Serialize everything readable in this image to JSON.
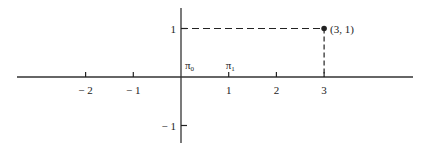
{
  "chart_data": {
    "type": "scatter",
    "title": "",
    "xlabel": "",
    "ylabel": "",
    "xlim": [
      -3.4,
      4.8
    ],
    "ylim": [
      -1.4,
      1.4
    ],
    "x_ticks": [
      {
        "value": -2,
        "label": "− 2"
      },
      {
        "value": -1,
        "label": "− 1"
      },
      {
        "value": 1,
        "label": "1"
      },
      {
        "value": 2,
        "label": "2"
      },
      {
        "value": 3,
        "label": "3"
      }
    ],
    "y_ticks": [
      {
        "value": 1,
        "label": "1"
      },
      {
        "value": -1,
        "label": "− 1"
      }
    ],
    "points": [
      {
        "x": 3,
        "y": 1,
        "label": "(3, 1)"
      }
    ],
    "axis_labels": [
      {
        "name": "pi0",
        "base": "π",
        "sub": "0",
        "x": 0
      },
      {
        "name": "pi1",
        "base": "π",
        "sub": "1",
        "x": 1
      }
    ],
    "grid": false,
    "colors": {
      "axis": "#333333",
      "ink": "#222222"
    }
  }
}
